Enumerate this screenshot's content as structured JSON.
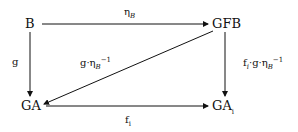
{
  "diagram": {
    "type": "commutative-diagram",
    "nodes": {
      "b": {
        "label": "B"
      },
      "gfb": {
        "label": "GFB"
      },
      "ga": {
        "label": "GA"
      },
      "gai": {
        "label": "GA",
        "subscript": "i"
      }
    },
    "arrows": {
      "b_to_gfb": {
        "from": "B",
        "to": "GFB",
        "label": "η",
        "label_sub": "B"
      },
      "b_to_ga": {
        "from": "B",
        "to": "GA",
        "label": "g"
      },
      "gfb_to_ga": {
        "from": "GFB",
        "to": "GA",
        "label": "g·η",
        "label_sub": "B",
        "label_sup": "−1"
      },
      "gfb_to_gai": {
        "from": "GFB",
        "to": "GA_i",
        "label_prefix": "f",
        "label_prefix_sub": "i",
        "label": "·g·η",
        "label_sub": "B",
        "label_sup": "−1"
      },
      "ga_to_gai": {
        "from": "GA",
        "to": "GA_i",
        "label": "f",
        "label_sub": "i"
      }
    },
    "colors": {
      "line": "#111111",
      "background": "#ffffff"
    }
  }
}
